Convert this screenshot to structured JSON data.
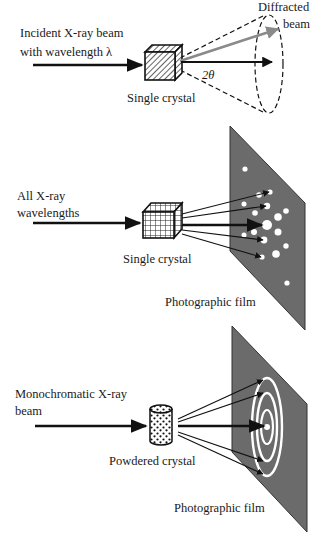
{
  "diagram": {
    "colors": {
      "background": "#ffffff",
      "ink": "#111111",
      "film": "#6b6b6b",
      "spot": "#ffffff",
      "diffracted_arrow": "#8a8a8a"
    },
    "panels": [
      {
        "id": "single-crystal-monochromatic",
        "incident_label_line1": "Incident X-ray beam",
        "incident_label_line2": "with wavelength λ",
        "sample_label": "Single crystal",
        "diffracted_label_line1": "Diffracted",
        "diffracted_label_line2": "beam",
        "angle_label": "2θ",
        "sample_icon": "hatched-cube"
      },
      {
        "id": "laue-method",
        "incident_label_line1": "All X-ray",
        "incident_label_line2": "wavelengths",
        "sample_label": "Single crystal",
        "detector_label": "Photographic film",
        "sample_icon": "grid-cube",
        "pattern": "spots"
      },
      {
        "id": "powder-method",
        "incident_label_line1": "Monochromatic X-ray",
        "incident_label_line2": "beam",
        "sample_label": "Powdered crystal",
        "detector_label": "Photographic film",
        "sample_icon": "dotted-cylinder",
        "pattern": "concentric-rings"
      }
    ]
  }
}
